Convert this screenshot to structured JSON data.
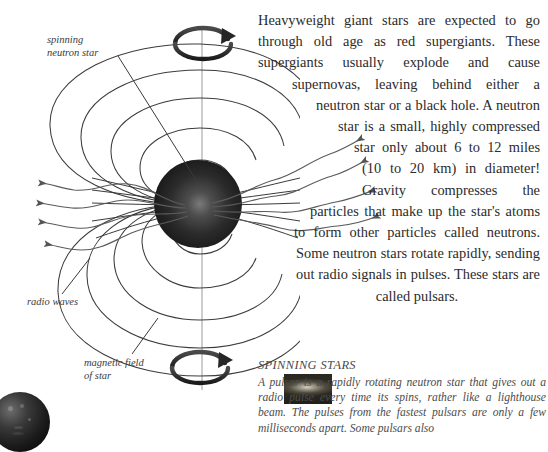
{
  "page": {
    "background": "#ffffff",
    "ink": "#2b2b2b"
  },
  "diagram": {
    "name": "neutron-star-magnetic-field-diagram",
    "labels": {
      "spinning_neutron_star": "spinning\nneutron star",
      "spinning_neutron_star_line1": "spinning",
      "spinning_neutron_star_line2": "neutron star",
      "radio_waves": "radio waves",
      "magnetic_field_line1": "magnetic field",
      "magnetic_field_line2": "of star"
    },
    "elements": {
      "star_sphere": "dark-sphere",
      "rotation_axis": "vertical-axis-line",
      "top_rotation_arrow": "rotation-arrow-icon",
      "bottom_rotation_arrow": "rotation-arrow-icon",
      "field_lines_count": 5,
      "radio_beam_arrows_left": 4,
      "radio_beam_arrows_right": 4
    },
    "colors": {
      "line": "#3a3a3a",
      "sphere_dark": "#1f1f1f",
      "sphere_highlight": "#6a6a6a",
      "axis": "#8c8c8c"
    }
  },
  "article": {
    "inset_image": "supernova-nebula-photo",
    "body": "Heavyweight giant stars are expected to go through old age as red supergiants. These supergiants usually explode and cause supernovas, leaving behind either a neutron star or a black hole. A neutron star is a small, highly compressed star only about 6 to 12 miles (10 to 20 km) in diameter! Gravity compresses the particles that make up the star's atoms to form other particles called neutrons. Some neutron stars rotate rapidly, sending out radio signals in pulses. These stars are called pulsars."
  },
  "caption": {
    "heading": "SPINNING STARS",
    "body": "A pulsar is a rapidly rotating neutron star that gives out a radio pulse every time its spins, rather like a lighthouse beam. The pulses from the fastest pulsars are only a few milliseconds apart. Some pulsars also"
  },
  "corner_photo": {
    "name": "moon-photo"
  }
}
